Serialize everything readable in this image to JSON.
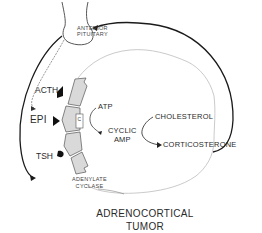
{
  "diagram": {
    "title_line1": "ADRENOCORTICAL",
    "title_line2": "TUMOR",
    "labels": {
      "anterior_pituitary_line1": "ANTERIOR",
      "anterior_pituitary_line2": "PITUITARY",
      "acth": "ACTH",
      "epi": "EPI",
      "tsh": "TSH",
      "atp": "ATP",
      "cyclic_amp_line1": "CYCLIC",
      "cyclic_amp_line2": "AMP",
      "cholesterol": "CHOLESTEROL",
      "corticosterone": "CORTICOSTERONE",
      "adenylate_cyclase_line1": "ADENYLATE",
      "adenylate_cyclase_line2": "CYCLASE",
      "c_unit": "C"
    },
    "colors": {
      "line": "#1a1a1a",
      "cell_outline": "#bdbdbd",
      "receptor_fill": "#d9d9d9",
      "receptor_stroke": "#555555"
    }
  }
}
